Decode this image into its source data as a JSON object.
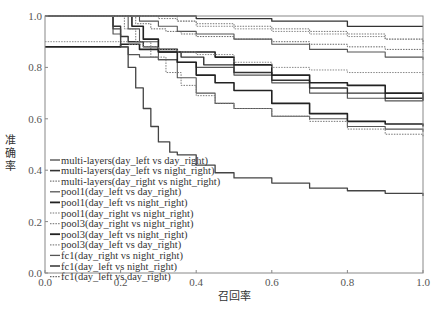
{
  "chart_data": {
    "type": "line",
    "title": "",
    "xlabel": "召回率",
    "ylabel": "准确率",
    "xlim": [
      0.0,
      1.0
    ],
    "ylim": [
      0.0,
      1.0
    ],
    "x_ticks": [
      "0.0",
      "0.2",
      "0.4",
      "0.6",
      "0.8",
      "1.0"
    ],
    "y_ticks": [
      "0.0",
      "0.2",
      "0.4",
      "0.6",
      "0.8",
      "1.0"
    ],
    "grid": false,
    "legend_position": "lower left",
    "series": [
      {
        "name": "multi-layers(day_left vs day_right)",
        "style": "solid",
        "color": "#555555",
        "width": 1.2,
        "x": [
          0.0,
          0.17,
          0.18,
          0.2,
          0.22,
          0.25,
          0.3,
          0.35,
          0.4,
          0.5,
          0.6,
          0.7,
          0.8,
          0.9,
          1.0
        ],
        "y": [
          1.0,
          1.0,
          0.93,
          0.88,
          0.85,
          0.84,
          0.83,
          0.82,
          0.8,
          0.77,
          0.74,
          0.7,
          0.68,
          0.67,
          0.67
        ]
      },
      {
        "name": "multi-layers(day_left vs night_right)",
        "style": "solid",
        "color": "#333333",
        "width": 1.4,
        "x": [
          0.0,
          0.16,
          0.18,
          0.2,
          0.22,
          0.26,
          0.3,
          0.36,
          0.42,
          0.5,
          0.6,
          0.7,
          0.8,
          0.9,
          1.0
        ],
        "y": [
          1.0,
          1.0,
          0.96,
          0.92,
          0.9,
          0.88,
          0.86,
          0.84,
          0.81,
          0.78,
          0.75,
          0.72,
          0.7,
          0.68,
          0.68
        ]
      },
      {
        "name": "multi-layers(day_right vs night_right)",
        "style": "dotted",
        "color": "#777777",
        "width": 1.0,
        "x": [
          0.0,
          0.28,
          0.3,
          0.35,
          0.4,
          0.5,
          0.6,
          0.7,
          0.8,
          0.9,
          1.0
        ],
        "y": [
          1.0,
          1.0,
          0.99,
          0.98,
          0.97,
          0.96,
          0.95,
          0.94,
          0.93,
          0.91,
          0.9
        ]
      },
      {
        "name": "pool1(day_left vs day_right)",
        "style": "solid",
        "color": "#555555",
        "width": 1.1,
        "x": [
          0.0,
          0.2,
          0.22,
          0.25,
          0.3,
          0.35,
          0.4,
          0.45,
          0.5,
          0.6,
          0.7,
          0.8,
          0.9,
          1.0
        ],
        "y": [
          1.0,
          1.0,
          0.95,
          0.9,
          0.83,
          0.76,
          0.7,
          0.66,
          0.64,
          0.61,
          0.6,
          0.57,
          0.56,
          0.55
        ]
      },
      {
        "name": "pool1(day_left vs night_right)",
        "style": "solid",
        "color": "#222222",
        "width": 1.6,
        "x": [
          0.0,
          0.21,
          0.23,
          0.26,
          0.3,
          0.35,
          0.4,
          0.45,
          0.5,
          0.6,
          0.7,
          0.8,
          0.9,
          1.0
        ],
        "y": [
          1.0,
          1.0,
          0.96,
          0.91,
          0.87,
          0.82,
          0.77,
          0.74,
          0.71,
          0.66,
          0.62,
          0.59,
          0.58,
          0.57
        ]
      },
      {
        "name": "pool1(day_right vs night_right)",
        "style": "dotted",
        "color": "#777777",
        "width": 1.0,
        "x": [
          0.0,
          0.19,
          0.21,
          0.24,
          0.28,
          0.32,
          0.36,
          0.4,
          0.45,
          0.5,
          0.6,
          0.7,
          0.8,
          0.9,
          1.0
        ],
        "y": [
          1.0,
          1.0,
          0.95,
          0.9,
          0.84,
          0.78,
          0.73,
          0.69,
          0.66,
          0.64,
          0.61,
          0.59,
          0.56,
          0.54,
          0.53
        ]
      },
      {
        "name": "pool3(day_right vs night_right)",
        "style": "dotted",
        "color": "#888888",
        "width": 1.0,
        "x": [
          0.0,
          0.3,
          0.35,
          0.4,
          0.5,
          0.6,
          0.7,
          0.8,
          0.9,
          1.0
        ],
        "y": [
          1.0,
          1.0,
          0.98,
          0.96,
          0.95,
          0.94,
          0.93,
          0.92,
          0.91,
          0.89
        ]
      },
      {
        "name": "pool3(day_left vs night_right)",
        "style": "solid",
        "color": "#222222",
        "width": 1.6,
        "x": [
          0.0,
          0.17,
          0.2,
          0.25,
          0.3,
          0.35,
          0.4,
          0.45,
          0.5,
          0.6,
          0.7,
          0.8,
          0.9,
          1.0
        ],
        "y": [
          0.88,
          0.88,
          0.89,
          0.87,
          0.86,
          0.86,
          0.86,
          0.84,
          0.81,
          0.77,
          0.74,
          0.73,
          0.7,
          0.67
        ]
      },
      {
        "name": "pool3(day_left vs day_right)",
        "style": "dotted",
        "color": "#888888",
        "width": 1.0,
        "x": [
          0.0,
          0.18,
          0.22,
          0.26,
          0.3,
          0.35,
          0.4,
          0.5,
          0.6,
          0.7,
          0.8,
          0.9,
          1.0
        ],
        "y": [
          0.9,
          0.9,
          0.89,
          0.88,
          0.87,
          0.86,
          0.85,
          0.82,
          0.8,
          0.79,
          0.78,
          0.78,
          0.77
        ]
      },
      {
        "name": "fc1(day_right vs night_right)",
        "style": "solid",
        "color": "#555555",
        "width": 1.1,
        "x": [
          0.0,
          0.22,
          0.25,
          0.3,
          0.35,
          0.4,
          0.5,
          0.6,
          0.7,
          0.8,
          0.9,
          1.0
        ],
        "y": [
          1.0,
          1.0,
          0.98,
          0.96,
          0.94,
          0.93,
          0.91,
          0.89,
          0.87,
          0.86,
          0.84,
          0.83
        ]
      },
      {
        "name": "fc1(day_left vs night_right)",
        "style": "solid",
        "color": "#333333",
        "width": 1.3,
        "x": [
          0.0,
          0.33,
          0.4,
          0.5,
          0.6,
          0.7,
          0.75,
          0.8,
          0.9,
          1.0
        ],
        "y": [
          1.0,
          1.0,
          0.99,
          0.99,
          0.98,
          0.98,
          0.98,
          0.96,
          0.96,
          0.96
        ]
      },
      {
        "name": "fc1(day_left vs day_right)",
        "style": "dotted",
        "color": "#666666",
        "width": 1.0,
        "x": [
          0.0,
          0.2,
          0.24,
          0.28,
          0.32,
          0.36,
          0.4,
          0.5,
          0.6,
          0.7,
          0.8,
          0.9,
          1.0
        ],
        "y": [
          1.0,
          1.0,
          0.97,
          0.95,
          0.94,
          0.93,
          0.92,
          0.91,
          0.9,
          0.89,
          0.88,
          0.87,
          0.86
        ]
      },
      {
        "name": "",
        "style": "solid",
        "color": "#444444",
        "width": 1.3,
        "hidden_legend": true,
        "x": [
          0.0,
          0.17,
          0.18,
          0.2,
          0.22,
          0.24,
          0.26,
          0.28,
          0.3,
          0.33,
          0.35,
          0.4,
          0.45,
          0.5,
          0.6,
          0.7,
          0.8,
          0.9,
          1.0
        ],
        "y": [
          1.0,
          1.0,
          0.95,
          0.88,
          0.8,
          0.72,
          0.64,
          0.57,
          0.51,
          0.47,
          0.46,
          0.42,
          0.39,
          0.37,
          0.35,
          0.33,
          0.32,
          0.31,
          0.3
        ]
      }
    ]
  },
  "axes": {
    "xlabel": "召回率",
    "ylabel_chars": [
      "准",
      "确",
      "率"
    ]
  }
}
